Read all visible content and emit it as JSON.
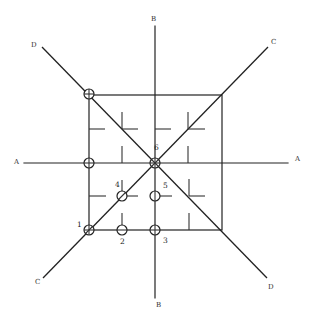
{
  "diagram": {
    "title": "",
    "axis_labels": {
      "A_left": "A",
      "A_right": "A",
      "B_top": "B",
      "B_bottom": "B",
      "C_top_right": "C",
      "C_bottom_left": "C",
      "D_top_left": "D",
      "D_bottom_right": "D"
    },
    "point_labels": {
      "p1": "1",
      "p2": "2",
      "p3": "3",
      "p4": "4",
      "p5": "5",
      "p6": "6"
    },
    "colors": {
      "line": "#222222",
      "background": "#ffffff"
    }
  }
}
